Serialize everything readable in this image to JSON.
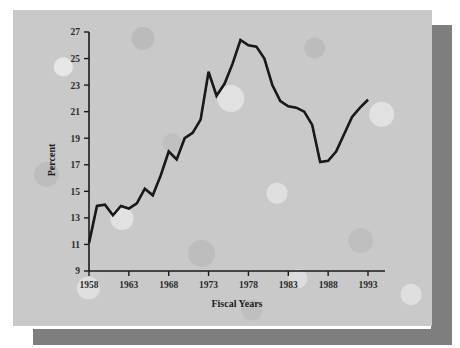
{
  "chart_data": {
    "type": "line",
    "title": "",
    "subtitle": "",
    "xlabel": "Fiscal Years",
    "ylabel": "Percent",
    "xlim": [
      1958,
      1993
    ],
    "ylim": [
      9,
      27
    ],
    "xticks": [
      1958,
      1963,
      1968,
      1973,
      1978,
      1983,
      1988,
      1993
    ],
    "ytick_labels": [
      "9",
      "11",
      "13",
      "15",
      "17",
      "19",
      "21",
      "23",
      "25",
      "27"
    ],
    "yticks": [
      9,
      11,
      13,
      15,
      17,
      19,
      21,
      23,
      25,
      27
    ],
    "grid": false,
    "legend": null,
    "annotations": [],
    "series": [
      {
        "name": "Percent",
        "color": "#1a1a1a",
        "x": [
          1958,
          1959,
          1960,
          1961,
          1962,
          1963,
          1964,
          1965,
          1966,
          1967,
          1968,
          1969,
          1970,
          1971,
          1972,
          1973,
          1974,
          1975,
          1976,
          1977,
          1978,
          1979,
          1980,
          1981,
          1982,
          1983,
          1984,
          1985,
          1986,
          1987,
          1988,
          1989,
          1990,
          1991,
          1992,
          1993
        ],
        "values": [
          11.1,
          13.9,
          14.0,
          13.2,
          13.9,
          13.7,
          14.1,
          15.2,
          14.7,
          16.2,
          18.0,
          17.4,
          19.0,
          19.4,
          20.4,
          24.0,
          22.2,
          23.1,
          24.6,
          26.4,
          26.0,
          25.9,
          25.0,
          23.0,
          21.8,
          21.4,
          21.3,
          21.0,
          20.0,
          17.2,
          17.3,
          18.0,
          19.3,
          20.6,
          21.3,
          21.9
        ]
      }
    ]
  },
  "axes": {
    "y_label": "Percent",
    "x_label": "Fiscal Years",
    "y_tick_labels": [
      "27",
      "25",
      "23",
      "21",
      "19",
      "17",
      "15",
      "13",
      "11",
      "9"
    ],
    "x_tick_labels": [
      "1958",
      "1963",
      "1968",
      "1973",
      "1978",
      "1983",
      "1988",
      "1993"
    ]
  },
  "style": {
    "panel_color": "#c9c9c9",
    "shadow_color": "#7e7e7e",
    "line_color": "#1a1a1a",
    "axis_color": "#1a1a1a",
    "text_color": "#2b2b2b"
  }
}
